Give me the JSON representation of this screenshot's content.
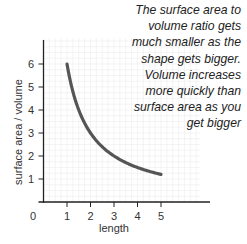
{
  "chart_data": {
    "type": "line",
    "title": "",
    "xlabel": "length",
    "ylabel": "surface area / volume",
    "x": [
      1,
      1.5,
      2,
      2.5,
      3,
      3.5,
      4,
      4.5,
      5
    ],
    "series": [
      {
        "name": "surface area / volume",
        "values": [
          6,
          4,
          3,
          2.4,
          2,
          1.71,
          1.5,
          1.33,
          1.2
        ]
      }
    ],
    "xticks": [
      "0",
      "1",
      "2",
      "3",
      "4",
      "5"
    ],
    "yticks": [
      "1",
      "2",
      "3",
      "4",
      "5",
      "6"
    ],
    "xlim": [
      0,
      6
    ],
    "ylim": [
      0,
      7
    ],
    "grid": true,
    "legend": "none",
    "annotation": [
      "The surface area to",
      "volume ratio gets",
      "much smaller as the",
      "shape gets bigger.",
      "Volume increases",
      "more quickly than",
      "surface area as you",
      "get bigger"
    ],
    "colors": {
      "curve": "#555555",
      "axis": "#222222",
      "grid": "#ececec"
    }
  }
}
